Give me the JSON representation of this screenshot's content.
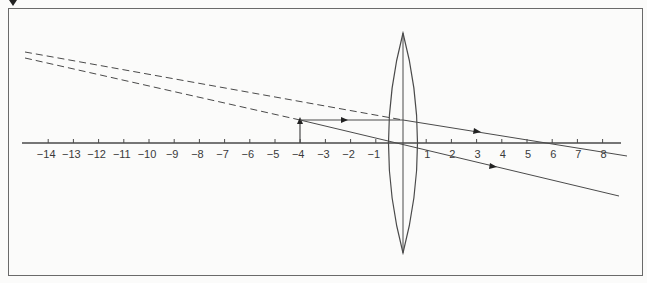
{
  "diagram": {
    "type": "ray-diagram-converging-lens",
    "colors": {
      "line": "#4a4a4a",
      "background": "#fbfbfa",
      "frame": "#6a6a6a"
    },
    "corner_marker": "down-triangle",
    "axis": {
      "tick_labels": [
        "-14",
        "-13",
        "-12",
        "-11",
        "-10",
        "-9",
        "-8",
        "-7",
        "-6",
        "-5",
        "-4",
        "-3",
        "-2",
        "-1",
        "1",
        "2",
        "3",
        "4",
        "5",
        "6",
        "7",
        "8"
      ],
      "tick_values": [
        -14,
        -13,
        -12,
        -11,
        -10,
        -9,
        -8,
        -7,
        -6,
        -5,
        -4,
        -3,
        -2,
        -1,
        1,
        2,
        3,
        4,
        5,
        6,
        7,
        8
      ]
    },
    "lens": {
      "type": "biconvex",
      "position": 0
    },
    "object": {
      "position": -4,
      "label": ""
    },
    "rays": [
      {
        "name": "parallel-ray",
        "from": -4,
        "refracted_through_focus": 6
      },
      {
        "name": "central-ray",
        "from": -4,
        "through": 0
      }
    ],
    "virtual_rays": [
      {
        "name": "virtual-extension-parallel-ray",
        "style": "dashed"
      },
      {
        "name": "virtual-extension-central-ray",
        "style": "dashed"
      }
    ]
  }
}
